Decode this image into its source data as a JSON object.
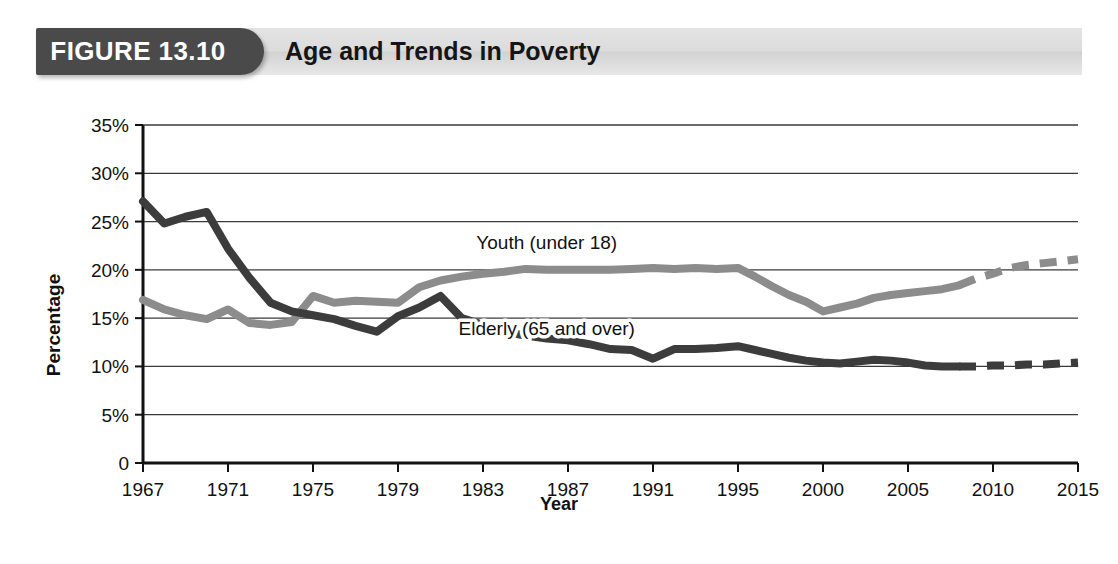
{
  "figure": {
    "badge_label": "FIGURE 13.10",
    "title": "Age and Trends in Poverty"
  },
  "chart_data": {
    "type": "line",
    "title": "Age and Trends in Poverty",
    "xlabel": "Year",
    "ylabel": "Percentage",
    "xlim": [
      1967,
      2015
    ],
    "ylim": [
      0,
      35
    ],
    "grid": true,
    "legend_position": "inline-annotation",
    "x_tick_labels": [
      "1967",
      "1971",
      "1975",
      "1979",
      "1983",
      "1987",
      "1991",
      "1995",
      "2000",
      "2005",
      "2010",
      "2015"
    ],
    "x_ticks": [
      1967,
      1971,
      1975,
      1979,
      1983,
      1987,
      1991,
      1995,
      2000,
      2005,
      2010,
      2015
    ],
    "y_tick_labels": [
      "0",
      "5%",
      "10%",
      "15%",
      "20%",
      "25%",
      "30%",
      "35%"
    ],
    "y_ticks": [
      0,
      5,
      10,
      15,
      20,
      25,
      30,
      35
    ],
    "series": [
      {
        "name": "Youth (under 18)",
        "color": "#8c8c8c",
        "annotation": "Youth (under 18)",
        "annotation_x": 1986,
        "annotation_y": 22.2,
        "projection_start_year": 2008,
        "x": [
          1967,
          1968,
          1969,
          1970,
          1971,
          1972,
          1973,
          1974,
          1975,
          1976,
          1977,
          1978,
          1979,
          1980,
          1981,
          1982,
          1983,
          1984,
          1985,
          1986,
          1987,
          1988,
          1989,
          1990,
          1991,
          1992,
          1993,
          1994,
          1995,
          1996,
          1997,
          1998,
          1999,
          2000,
          2001,
          2002,
          2003,
          2004,
          2005,
          2006,
          2007,
          2008,
          2009,
          2010,
          2011,
          2012,
          2013,
          2014,
          2015
        ],
        "y": [
          16.9,
          15.9,
          15.3,
          14.9,
          15.9,
          14.5,
          14.3,
          14.6,
          17.3,
          16.6,
          16.8,
          16.7,
          16.6,
          18.2,
          18.9,
          19.3,
          19.6,
          19.8,
          20.1,
          20.0,
          20.0,
          20.0,
          20.0,
          20.1,
          20.2,
          20.1,
          20.2,
          20.1,
          20.2,
          19.3,
          18.3,
          17.4,
          16.7,
          15.7,
          16.1,
          16.5,
          17.1,
          17.4,
          17.6,
          17.8,
          18.0,
          18.4,
          19.1,
          19.6,
          20.2,
          20.5,
          20.7,
          20.9,
          21.1
        ]
      },
      {
        "name": "Elderly (65 and over)",
        "color": "#3c3c3c",
        "annotation": "Elderly (65 and over)",
        "annotation_x": 1986,
        "annotation_y": 13.3,
        "projection_start_year": 2008,
        "x": [
          1967,
          1968,
          1969,
          1970,
          1971,
          1972,
          1973,
          1974,
          1975,
          1976,
          1977,
          1978,
          1979,
          1980,
          1981,
          1982,
          1983,
          1984,
          1985,
          1986,
          1987,
          1988,
          1989,
          1990,
          1991,
          1992,
          1993,
          1994,
          1995,
          1996,
          1997,
          1998,
          1999,
          2000,
          2001,
          2002,
          2003,
          2004,
          2005,
          2006,
          2007,
          2008,
          2009,
          2010,
          2011,
          2012,
          2013,
          2014,
          2015
        ],
        "y": [
          27.1,
          24.8,
          25.5,
          26.0,
          22.2,
          19.2,
          16.6,
          15.7,
          15.3,
          14.9,
          14.2,
          13.6,
          15.2,
          16.1,
          17.3,
          15.0,
          14.3,
          13.6,
          13.2,
          12.9,
          12.7,
          12.3,
          11.8,
          11.7,
          10.8,
          11.8,
          11.8,
          11.9,
          12.1,
          11.7,
          11.3,
          10.9,
          10.6,
          10.4,
          10.3,
          10.5,
          10.7,
          10.6,
          10.4,
          10.1,
          10.0,
          10.0,
          10.0,
          10.1,
          10.1,
          10.2,
          10.2,
          10.3,
          10.4
        ]
      }
    ]
  }
}
